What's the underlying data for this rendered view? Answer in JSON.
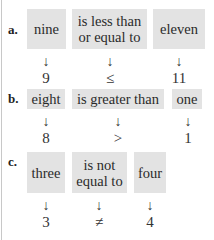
{
  "rows": [
    {
      "label": "a.",
      "words": [
        "nine",
        "is less than or equal to",
        "eleven"
      ],
      "arrows": [
        "↓",
        "↓",
        "↓"
      ],
      "symbols": [
        "9",
        "≤",
        "11"
      ]
    },
    {
      "label": "b.",
      "words": [
        "eight",
        "is greater than",
        "one"
      ],
      "arrows": [
        "↓",
        "↓",
        "↓"
      ],
      "symbols": [
        "8",
        ">",
        "1"
      ]
    },
    {
      "label": "c.",
      "words": [
        "three",
        "is not equal to",
        "four"
      ],
      "arrows": [
        "↓",
        "↓",
        "↓"
      ],
      "symbols": [
        "3",
        "≠",
        "4"
      ]
    }
  ],
  "colors": {
    "box": "#e3e3e3",
    "text": "#222222"
  }
}
